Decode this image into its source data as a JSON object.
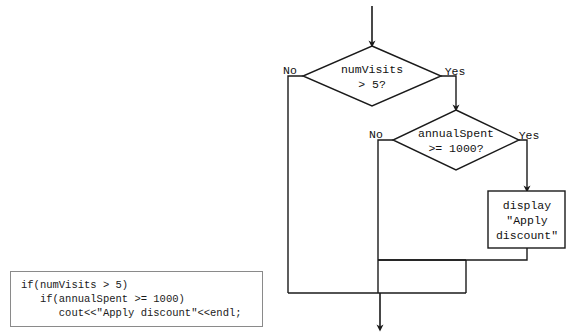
{
  "diagram": {
    "stroke_color": "#1a1a1a",
    "box_fill": "#ffffff",
    "nodes": {
      "decision1": {
        "shape": "diamond",
        "line1": "numVisits",
        "line2": "> 5?",
        "yes_label": "Yes",
        "no_label": "No"
      },
      "decision2": {
        "shape": "diamond",
        "line1": "annualSpent",
        "line2": ">= 1000?",
        "yes_label": "Yes",
        "no_label": "No"
      },
      "process1": {
        "shape": "rectangle",
        "line1": "display",
        "line2": "\"Apply",
        "line3": "discount\""
      }
    }
  },
  "code_panel": {
    "language": "cpp",
    "line1": "if(numVisits > 5)",
    "line2": "   if(annualSpent >= 1000)",
    "line3": "      cout<<\"Apply discount\"<<endl;",
    "full_text": "if(numVisits > 5)\n   if(annualSpent >= 1000)\n      cout<<\"Apply discount\"<<endl;"
  }
}
